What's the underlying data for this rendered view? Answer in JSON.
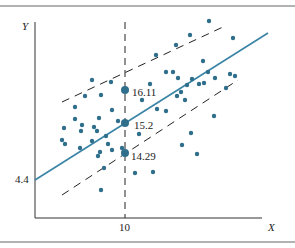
{
  "chart_data": {
    "type": "scatter",
    "title": "",
    "xlabel": "X",
    "ylabel": "Y",
    "x_ticks": [
      "10"
    ],
    "y_ticks": [
      "4.4"
    ],
    "grid": false,
    "legend": null,
    "regression_line": {
      "intercept_label": "4.4",
      "description": "Fitted line Y = a + bX with intercept 4.4"
    },
    "prediction_band": {
      "at_x": "10",
      "upper": "16.11",
      "mean": "15.2",
      "lower": "14.29",
      "style": "dashed parallel lines"
    },
    "annotations": [
      "16.11",
      "15.2",
      "14.29"
    ],
    "points_pixel": [
      [
        92,
        80
      ],
      [
        111,
        82
      ],
      [
        85,
        96
      ],
      [
        101,
        95
      ],
      [
        75,
        107
      ],
      [
        112,
        110
      ],
      [
        75,
        119
      ],
      [
        64,
        128
      ],
      [
        82,
        125
      ],
      [
        94,
        127
      ],
      [
        99,
        118
      ],
      [
        118,
        121
      ],
      [
        62,
        140
      ],
      [
        65,
        144
      ],
      [
        81,
        131
      ],
      [
        92,
        141
      ],
      [
        97,
        131
      ],
      [
        80,
        148
      ],
      [
        108,
        144
      ],
      [
        106,
        136
      ],
      [
        100,
        152
      ],
      [
        112,
        150
      ],
      [
        98,
        156
      ],
      [
        104,
        168
      ],
      [
        101,
        190
      ],
      [
        135,
        173
      ],
      [
        153,
        172
      ],
      [
        122,
        148
      ],
      [
        156,
        55
      ],
      [
        176,
        45
      ],
      [
        190,
        35
      ],
      [
        209,
        21
      ],
      [
        233,
        38
      ],
      [
        173,
        72
      ],
      [
        203,
        61
      ],
      [
        166,
        72
      ],
      [
        178,
        78
      ],
      [
        192,
        79
      ],
      [
        208,
        72
      ],
      [
        230,
        74
      ],
      [
        235,
        76
      ],
      [
        215,
        78
      ],
      [
        226,
        88
      ],
      [
        199,
        84
      ],
      [
        204,
        83
      ],
      [
        150,
        84
      ],
      [
        181,
        92
      ],
      [
        187,
        85
      ],
      [
        142,
        100
      ],
      [
        177,
        96
      ],
      [
        185,
        100
      ],
      [
        157,
        109
      ],
      [
        166,
        111
      ],
      [
        214,
        116
      ],
      [
        139,
        134
      ],
      [
        191,
        133
      ],
      [
        182,
        145
      ],
      [
        197,
        154
      ]
    ]
  },
  "labels": {
    "y_axis": "Y",
    "x_axis": "X",
    "x_tick_10": "10",
    "y_intercept": "4.4",
    "upper_value": "16.11",
    "mean_value": "15.2",
    "lower_value": "14.29"
  },
  "colors": {
    "points": "#2f6f8c",
    "regression": "#3a84a6",
    "axes": "#333333",
    "dashed": "#222222",
    "frame": "#555555"
  }
}
